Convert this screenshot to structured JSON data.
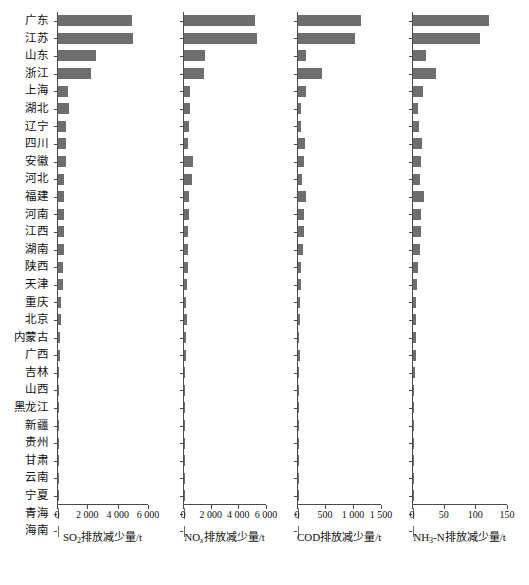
{
  "chart_data": {
    "type": "bar",
    "orientation": "horizontal",
    "title": "",
    "categories": [
      "广东",
      "江苏",
      "山东",
      "浙江",
      "上海",
      "湖北",
      "辽宁",
      "四川",
      "安徽",
      "河北",
      "福建",
      "河南",
      "江西",
      "湖南",
      "陕西",
      "天津",
      "重庆",
      "北京",
      "内蒙古",
      "广西",
      "吉林",
      "山西",
      "黑龙江",
      "新疆",
      "贵州",
      "甘肃",
      "云南",
      "宁夏",
      "青海",
      "海南"
    ],
    "panels": [
      {
        "id": "so2",
        "xlabel_html": "SO<sub>2</sub>排放减少量/t",
        "xlabel_text": "SO2排放减少量/t",
        "xlim": [
          0,
          6000
        ],
        "ticks": [
          0,
          2000,
          4000,
          6000
        ],
        "ticklabels": [
          "0",
          "2 000",
          "4 000",
          "6 000"
        ],
        "values": [
          4880,
          4950,
          2500,
          2200,
          680,
          740,
          530,
          500,
          520,
          410,
          370,
          400,
          400,
          390,
          360,
          300,
          210,
          190,
          140,
          100,
          95,
          90,
          80,
          30,
          25,
          20,
          18,
          15,
          10,
          8
        ]
      },
      {
        "id": "nox",
        "xlabel_html": "NO<i>x</i>排放减少量/t",
        "xlabel_text": "NOx排放减少量/t",
        "xlim": [
          0,
          6000
        ],
        "ticks": [
          0,
          2000,
          4000,
          6000
        ],
        "ticklabels": [
          "0",
          "2 000",
          "4 000",
          "6 000"
        ],
        "values": [
          5150,
          5250,
          1500,
          1480,
          430,
          400,
          390,
          300,
          620,
          590,
          330,
          330,
          300,
          300,
          290,
          250,
          150,
          210,
          130,
          110,
          100,
          95,
          80,
          30,
          25,
          20,
          18,
          12,
          10,
          8
        ]
      },
      {
        "id": "cod",
        "xlabel_html": "COD排放减少量/t",
        "xlabel_text": "COD排放减少量/t",
        "xlim": [
          0,
          1500
        ],
        "ticks": [
          0,
          500,
          1000,
          1500
        ],
        "ticklabels": [
          "0",
          "500",
          "1 000",
          "1 500"
        ],
        "values": [
          1120,
          1020,
          150,
          430,
          140,
          45,
          60,
          130,
          110,
          80,
          150,
          110,
          100,
          95,
          60,
          45,
          35,
          40,
          25,
          30,
          20,
          15,
          15,
          8,
          8,
          6,
          6,
          4,
          3,
          3
        ]
      },
      {
        "id": "nh3n",
        "xlabel_html": "NH<sub>3</sub>-N排放减少量/t",
        "xlabel_text": "NH3-N排放减少量/t",
        "xlim": [
          0,
          150
        ],
        "ticks": [
          0,
          50,
          100,
          150
        ],
        "ticklabels": [
          "0",
          "50",
          "100",
          "150"
        ],
        "values": [
          120,
          105,
          20,
          37,
          16,
          8,
          10,
          14,
          13,
          11,
          17,
          13,
          12,
          11,
          8,
          6,
          5,
          5,
          4,
          4,
          3,
          2,
          2,
          1.5,
          1.2,
          1,
          1,
          0.8,
          0.6,
          0.5
        ]
      }
    ],
    "bar_color": "#6e6e6e",
    "axis_color": "#4a4a4a",
    "grid": false,
    "legend": "none"
  }
}
